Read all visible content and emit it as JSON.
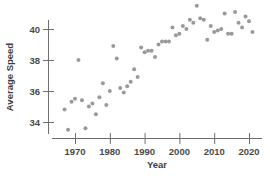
{
  "chart_data": {
    "type": "scatter",
    "title": "",
    "xlabel": "Year",
    "ylabel": "Average Speed",
    "xlim": [
      1966,
      2023
    ],
    "ylim": [
      33.2,
      41.6
    ],
    "grid": false,
    "legend": null,
    "xticks": [
      1970,
      1980,
      1990,
      2000,
      2010,
      2020
    ],
    "xtick_labels": [
      "1970",
      "1980",
      "1990",
      "2000",
      "2010",
      "2020"
    ],
    "yticks": [
      34,
      36,
      38,
      40
    ],
    "ytick_labels": [
      "34",
      "36",
      "38",
      "40"
    ],
    "marker": {
      "shape": "circle",
      "color": "#9a9a9a",
      "size": 2.0
    },
    "series": [
      {
        "name": "Average Speed",
        "x": [
          1967,
          1968,
          1969,
          1970,
          1971,
          1972,
          1973,
          1974,
          1975,
          1976,
          1977,
          1978,
          1979,
          1980,
          1981,
          1982,
          1983,
          1984,
          1985,
          1986,
          1987,
          1988,
          1989,
          1990,
          1991,
          1992,
          1993,
          1994,
          1995,
          1996,
          1997,
          1998,
          1999,
          2000,
          2001,
          2002,
          2003,
          2004,
          2005,
          2006,
          2007,
          2008,
          2009,
          2010,
          2011,
          2012,
          2013,
          2014,
          2015,
          2016,
          2017,
          2018,
          2019,
          2020,
          2021
        ],
        "y": [
          34.8,
          33.5,
          35.3,
          35.5,
          38.0,
          35.4,
          33.6,
          35.0,
          35.2,
          34.5,
          35.6,
          36.5,
          35.1,
          36.0,
          38.9,
          38.1,
          36.2,
          35.9,
          36.3,
          36.6,
          37.4,
          36.9,
          38.8,
          38.5,
          38.6,
          38.6,
          38.2,
          39.0,
          39.2,
          39.2,
          39.2,
          40.1,
          39.6,
          39.7,
          40.2,
          40.0,
          40.6,
          40.4,
          41.5,
          40.7,
          40.6,
          39.3,
          40.2,
          39.8,
          39.9,
          40.0,
          41.0,
          39.7,
          39.7,
          41.1,
          40.4,
          40.1,
          40.8,
          40.5,
          39.8
        ]
      }
    ]
  },
  "axes": {
    "y_title": "Average Speed",
    "x_title": "Year"
  }
}
